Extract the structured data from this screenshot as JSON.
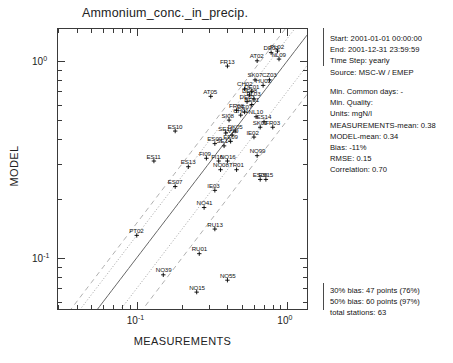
{
  "chart_data": {
    "type": "scatter",
    "title": "Ammonium_conc._in_precip.",
    "xlabel": "MEASUREMENTS",
    "ylabel": "MODEL",
    "xscale": "log",
    "yscale": "log",
    "xlim": [
      0.03,
      1.35
    ],
    "ylim": [
      0.055,
      1.45
    ],
    "xticks": [
      "10-1",
      "100"
    ],
    "yticks": [
      "100",
      "10-1"
    ],
    "grid": false,
    "legend": "none",
    "reference_lines": [
      {
        "name": "one-to-one",
        "style": "solid",
        "ratio": 1.0
      },
      {
        "name": "plus-30-percent-bias",
        "style": "dotted",
        "ratio": 1.3
      },
      {
        "name": "minus-30-percent-bias",
        "style": "dotted",
        "ratio": 0.7
      },
      {
        "name": "plus-50-percent-bias",
        "style": "dashed",
        "ratio": 1.5
      },
      {
        "name": "minus-50-percent-bias",
        "style": "dashed",
        "ratio": 0.5
      }
    ],
    "points": [
      {
        "label": "NL09",
        "x": 0.88,
        "y": 1.02
      },
      {
        "label": "DE02",
        "x": 0.78,
        "y": 1.1
      },
      {
        "label": "PL02",
        "x": 0.86,
        "y": 1.12
      },
      {
        "label": "AT02",
        "x": 0.63,
        "y": 1.0
      },
      {
        "label": "FR13",
        "x": 0.4,
        "y": 0.94
      },
      {
        "label": "SK07",
        "x": 0.61,
        "y": 0.8
      },
      {
        "label": "CZ03",
        "x": 0.76,
        "y": 0.8
      },
      {
        "label": "HU02",
        "x": 0.69,
        "y": 0.75
      },
      {
        "label": "CH02",
        "x": 0.52,
        "y": 0.72
      },
      {
        "label": "DE01",
        "x": 0.58,
        "y": 0.7
      },
      {
        "label": "DE08",
        "x": 0.56,
        "y": 0.67
      },
      {
        "label": "AT05",
        "x": 0.31,
        "y": 0.66
      },
      {
        "label": "PL03",
        "x": 0.6,
        "y": 0.64
      },
      {
        "label": "DE03",
        "x": 0.54,
        "y": 0.62
      },
      {
        "label": "BE01",
        "x": 0.58,
        "y": 0.6
      },
      {
        "label": "FR08",
        "x": 0.46,
        "y": 0.56
      },
      {
        "label": "DE07",
        "x": 0.52,
        "y": 0.55
      },
      {
        "label": "CH01",
        "x": 0.49,
        "y": 0.53
      },
      {
        "label": "NL10",
        "x": 0.62,
        "y": 0.52
      },
      {
        "label": "SI08",
        "x": 0.41,
        "y": 0.5
      },
      {
        "label": "ES14",
        "x": 0.7,
        "y": 0.49
      },
      {
        "label": "SK02",
        "x": 0.66,
        "y": 0.46
      },
      {
        "label": "FR03",
        "x": 0.8,
        "y": 0.46
      },
      {
        "label": "ES10",
        "x": 0.18,
        "y": 0.44
      },
      {
        "label": "DK05",
        "x": 0.45,
        "y": 0.44
      },
      {
        "label": "SE11",
        "x": 0.39,
        "y": 0.43
      },
      {
        "label": "LV10",
        "x": 0.43,
        "y": 0.42
      },
      {
        "label": "IE02",
        "x": 0.6,
        "y": 0.41
      },
      {
        "label": "EE09",
        "x": 0.42,
        "y": 0.39
      },
      {
        "label": "ES09",
        "x": 0.33,
        "y": 0.38
      },
      {
        "label": "SE14",
        "x": 0.38,
        "y": 0.37
      },
      {
        "label": "NO99",
        "x": 0.63,
        "y": 0.33
      },
      {
        "label": "ES11",
        "x": 0.13,
        "y": 0.31
      },
      {
        "label": "FI09",
        "x": 0.29,
        "y": 0.32
      },
      {
        "label": "FI16",
        "x": 0.35,
        "y": 0.31
      },
      {
        "label": "NO16",
        "x": 0.4,
        "y": 0.31
      },
      {
        "label": "ES13",
        "x": 0.22,
        "y": 0.29
      },
      {
        "label": "NO08",
        "x": 0.36,
        "y": 0.28
      },
      {
        "label": "TR01",
        "x": 0.46,
        "y": 0.28
      },
      {
        "label": "ES08",
        "x": 0.66,
        "y": 0.25
      },
      {
        "label": "ES15",
        "x": 0.72,
        "y": 0.25
      },
      {
        "label": "ES07",
        "x": 0.18,
        "y": 0.23
      },
      {
        "label": "IE03",
        "x": 0.33,
        "y": 0.22
      },
      {
        "label": "NO41",
        "x": 0.28,
        "y": 0.18
      },
      {
        "label": "PT02",
        "x": 0.1,
        "y": 0.13
      },
      {
        "label": "RU13",
        "x": 0.33,
        "y": 0.14
      },
      {
        "label": "RU01",
        "x": 0.26,
        "y": 0.105
      },
      {
        "label": "NO39",
        "x": 0.15,
        "y": 0.082
      },
      {
        "label": "NO55",
        "x": 0.4,
        "y": 0.077
      },
      {
        "label": "NO15",
        "x": 0.25,
        "y": 0.067
      }
    ]
  },
  "info": {
    "header": [
      "Start: 2001-01-01 00:00:00",
      "End: 2001-12-31 23:59:59",
      "Time Step: yearly",
      "Source: MSC-W / EMEP"
    ],
    "stats": [
      "Min. Common days: -",
      "Min. Quality:",
      "Units: mgN/l",
      "MEASUREMENTS-mean: 0.38",
      "MODEL-mean: 0.34",
      "Bias: -11%",
      "RMSE: 0.15",
      "Correlation: 0.70"
    ],
    "bias": [
      "30% bias: 47 points (76%)",
      "50% bias: 60 points (97%)",
      "total stations: 63"
    ]
  },
  "axis": {
    "x_label": "MEASUREMENTS",
    "y_label": "MODEL",
    "x_tick_1_base": "10",
    "x_tick_1_exp": "-1",
    "x_tick_2_base": "10",
    "x_tick_2_exp": "0",
    "y_tick_1_base": "10",
    "y_tick_1_exp": "0",
    "y_tick_2_base": "10",
    "y_tick_2_exp": "-1"
  },
  "colors": {
    "axis": "#3a3a3a",
    "text": "#111111",
    "line_solid": "#555555",
    "line_dotted": "#8a8a8a",
    "line_dashed": "#9a9a9a",
    "marker": "#000000"
  }
}
